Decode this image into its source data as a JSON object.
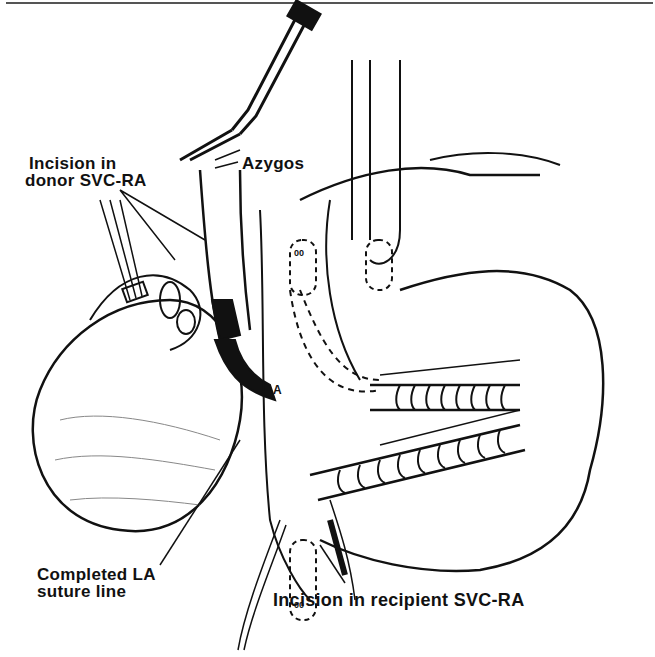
{
  "figure": {
    "type": "surgical illustration",
    "labels": {
      "donor_incision_line1": "Incision in",
      "donor_incision_line2": "donor SVC-RA",
      "azygos": "Azygos",
      "completed_la_line1": "Completed LA",
      "completed_la_line2": "suture line",
      "recipient_incision": "Incision in recipient SVC-RA",
      "marker_a_upper": "A",
      "marker_a_lower": "A",
      "clamp_upper": "00",
      "clamp_lower": "00"
    },
    "colors": {
      "ink": "#111111",
      "paper": "#ffffff",
      "rule": "#555555"
    }
  }
}
